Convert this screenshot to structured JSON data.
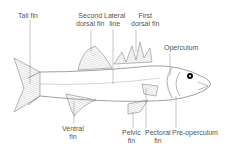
{
  "diagram": {
    "labels": {
      "tail_fin": "Tail fin",
      "second_dorsal_fin_1": "Second",
      "second_dorsal_fin_2": "dorsal fin",
      "lateral_line_1": "Lateral",
      "lateral_line_2": "line",
      "first_dorsal_fin_1": "First",
      "first_dorsal_fin_2": "dorsal fin",
      "operculum": "Operculum",
      "ventral_fin_1": "Ventral",
      "ventral_fin_2": "fin",
      "pelvic_fin_1": "Pelvic",
      "pelvic_fin_2": "fin",
      "pectoral_fin_1": "Pectoral",
      "pectoral_fin_2": "fin",
      "pre_operculum": "Pre-operculum"
    },
    "colors": {
      "line": "#888888",
      "text": "#555555",
      "eye": "#111111"
    }
  }
}
